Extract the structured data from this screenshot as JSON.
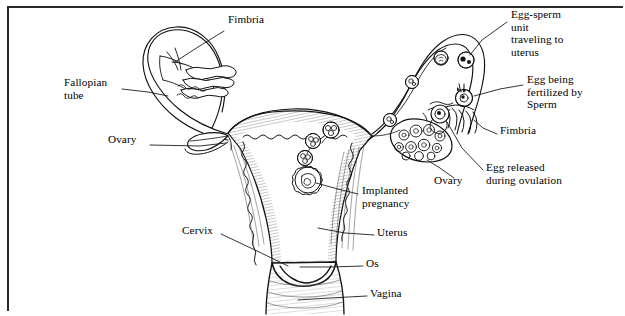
{
  "figure": {
    "background_color": "#ffffff",
    "ink_color": "#000000",
    "border_color": "#2a2a2a",
    "labels": [
      {
        "id": "fimbria-left",
        "text": "Fimbria",
        "x": 228,
        "y": 19,
        "align": "left",
        "leader": "M 224 31 L 198 47 L 175 62"
      },
      {
        "id": "fallopian-tube",
        "text": "Fallopian\ntube",
        "x": 64,
        "y": 82,
        "align": "left",
        "leader": "M 122 89 L 148 92 L 168 96"
      },
      {
        "id": "ovary-left",
        "text": "Ovary",
        "x": 108,
        "y": 139,
        "align": "left",
        "leader": "M 148 145 L 200 146 L 228 143"
      },
      {
        "id": "egg-sperm-unit",
        "text": "Egg-sperm\nunit\ntraveling to\nuterus",
        "x": 511,
        "y": 11,
        "align": "left",
        "leader": "M 507 22 L 480 40 L 462 53"
      },
      {
        "id": "egg-being-fertilized",
        "text": "Egg being\nfertilized by\nSperm",
        "x": 527,
        "y": 79,
        "align": "left",
        "leader": "M 523 85 L 500 89 L 478 96"
      },
      {
        "id": "fimbria-right",
        "text": "Fimbria",
        "x": 500,
        "y": 130,
        "align": "left",
        "leader": "M 497 134 L 483 128 L 473 120"
      },
      {
        "id": "egg-released",
        "text": "Egg released\nduring ovulation",
        "x": 486,
        "y": 166,
        "align": "left",
        "leader": "M 483 170 L 462 153 L 449 139"
      },
      {
        "id": "ovary-right",
        "text": "Ovary",
        "x": 434,
        "y": 179,
        "align": "left",
        "leader": "M 452 178 L 443 168 L 434 157"
      },
      {
        "id": "implanted-pregnancy",
        "text": "Implanted\npregnancy",
        "x": 362,
        "y": 189,
        "align": "left",
        "leader": "M 358 194 L 338 189 L 320 184"
      },
      {
        "id": "uterus",
        "text": "Uterus",
        "x": 377,
        "y": 230,
        "align": "left",
        "leader": "M 374 235 L 345 233 L 316 228"
      },
      {
        "id": "cervix",
        "text": "Cervix",
        "x": 182,
        "y": 228,
        "align": "left",
        "leader": "M 221 234 L 252 248 L 280 262"
      },
      {
        "id": "os",
        "text": "Os",
        "x": 366,
        "y": 261,
        "align": "left",
        "leader": "M 363 266 L 330 266 L 298 266"
      },
      {
        "id": "vagina",
        "text": "Vagina",
        "x": 370,
        "y": 291,
        "align": "left",
        "leader": "M 367 296 L 330 297 L 297 299"
      }
    ]
  }
}
